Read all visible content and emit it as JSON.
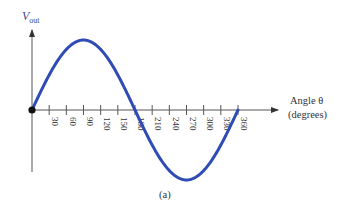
{
  "figure": {
    "caption": "(a)",
    "y_axis_label": "V",
    "y_axis_label_sub": "out",
    "x_axis_label_line1": "Angle θ",
    "x_axis_label_line2": "(degrees)",
    "curve_color": "#2f4bb5",
    "axis_color": "#555555"
  },
  "chart_data": {
    "type": "line",
    "title": "",
    "xlabel": "Angle θ (degrees)",
    "ylabel": "Vout",
    "x_ticks": [
      30,
      60,
      90,
      120,
      150,
      180,
      210,
      240,
      270,
      300,
      330,
      360
    ],
    "tick_labels": [
      "30",
      "60",
      "90",
      "120",
      "150",
      "180",
      "210",
      "240",
      "270",
      "300",
      "330",
      "360"
    ],
    "xlim": [
      0,
      360
    ],
    "ylim": [
      -1,
      1
    ],
    "grid": false,
    "legend": "none",
    "series": [
      {
        "name": "Vout = sin(θ)",
        "x": [
          0,
          30,
          60,
          90,
          120,
          150,
          180,
          210,
          240,
          270,
          300,
          330,
          360
        ],
        "values": [
          0,
          0.5,
          0.866,
          1,
          0.866,
          0.5,
          0,
          -0.5,
          -0.866,
          -1,
          -0.866,
          -0.5,
          0
        ]
      }
    ],
    "annotations": [
      "origin marked with a filled dot at (0, 0)"
    ]
  }
}
